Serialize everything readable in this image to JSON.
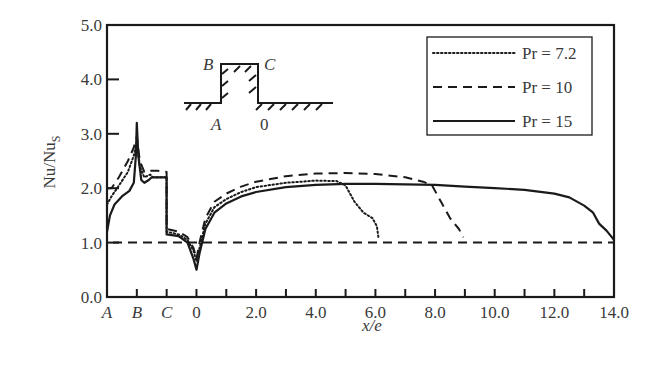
{
  "chart_data": {
    "type": "line",
    "title": "",
    "xlabel": "x/e",
    "ylabel": "Nu/Nu",
    "ylabel_subscript": "S",
    "xlim": [
      -3,
      14
    ],
    "ylim": [
      0,
      5
    ],
    "grid": false,
    "legend_position": "upper right",
    "x_ticks": [
      {
        "value": -3,
        "label": "A",
        "italic": true
      },
      {
        "value": -2,
        "label": "B",
        "italic": true
      },
      {
        "value": -1,
        "label": "C",
        "italic": true
      },
      {
        "value": 0,
        "label": "0",
        "italic": false
      },
      {
        "value": 1,
        "label": "",
        "italic": false
      },
      {
        "value": 2,
        "label": "2.0",
        "italic": false
      },
      {
        "value": 3,
        "label": "",
        "italic": false
      },
      {
        "value": 4,
        "label": "4.0",
        "italic": false
      },
      {
        "value": 5,
        "label": "",
        "italic": false
      },
      {
        "value": 6,
        "label": "6.0",
        "italic": false
      },
      {
        "value": 7,
        "label": "",
        "italic": false
      },
      {
        "value": 8,
        "label": "8.0",
        "italic": false
      },
      {
        "value": 9,
        "label": "",
        "italic": false
      },
      {
        "value": 10,
        "label": "10.0",
        "italic": false
      },
      {
        "value": 11,
        "label": "",
        "italic": false
      },
      {
        "value": 12,
        "label": "12.0",
        "italic": false
      },
      {
        "value": 13,
        "label": "",
        "italic": false
      },
      {
        "value": 14,
        "label": "14.0",
        "italic": false
      }
    ],
    "y_ticks": [
      {
        "value": 0,
        "label": "0.0"
      },
      {
        "value": 1,
        "label": "1.0"
      },
      {
        "value": 2,
        "label": "2.0"
      },
      {
        "value": 3,
        "label": "3.0"
      },
      {
        "value": 4,
        "label": "4.0"
      },
      {
        "value": 5,
        "label": "5.0"
      }
    ],
    "reference_line": {
      "y": 1.0,
      "style": "dashed"
    },
    "series": [
      {
        "name": "Pr = 7.2",
        "style": "dotted",
        "points": [
          [
            -3,
            1.7
          ],
          [
            -2.85,
            1.85
          ],
          [
            -2.6,
            2.05
          ],
          [
            -2.3,
            2.3
          ],
          [
            -2.1,
            2.6
          ],
          [
            -2,
            2.85
          ],
          [
            -1.9,
            2.4
          ],
          [
            -1.75,
            2.2
          ],
          [
            -1.55,
            2.25
          ],
          [
            -1.45,
            2.2
          ],
          [
            -1,
            2.2
          ],
          [
            -1,
            1.2
          ],
          [
            -0.6,
            1.15
          ],
          [
            -0.3,
            1.05
          ],
          [
            -0.1,
            0.85
          ],
          [
            0,
            0.65
          ],
          [
            0.1,
            0.9
          ],
          [
            0.3,
            1.35
          ],
          [
            0.6,
            1.65
          ],
          [
            1,
            1.8
          ],
          [
            1.5,
            1.93
          ],
          [
            2,
            2.02
          ],
          [
            3,
            2.1
          ],
          [
            4,
            2.14
          ],
          [
            4.7,
            2.13
          ],
          [
            5.0,
            2.05
          ],
          [
            5.3,
            1.75
          ],
          [
            5.6,
            1.55
          ],
          [
            5.9,
            1.45
          ],
          [
            6.05,
            1.3
          ],
          [
            6.1,
            1.1
          ]
        ]
      },
      {
        "name": "Pr = 10",
        "style": "dashed",
        "points": [
          [
            -3,
            2.0
          ],
          [
            -2.85,
            2.0
          ],
          [
            -2.6,
            2.2
          ],
          [
            -2.3,
            2.5
          ],
          [
            -2.1,
            2.75
          ],
          [
            -2,
            2.95
          ],
          [
            -1.9,
            2.5
          ],
          [
            -1.75,
            2.3
          ],
          [
            -1.55,
            2.32
          ],
          [
            -1.3,
            2.32
          ],
          [
            -1,
            2.3
          ],
          [
            -1,
            1.25
          ],
          [
            -0.6,
            1.2
          ],
          [
            -0.3,
            1.1
          ],
          [
            -0.1,
            0.9
          ],
          [
            0,
            0.7
          ],
          [
            0.1,
            1.0
          ],
          [
            0.3,
            1.45
          ],
          [
            0.6,
            1.75
          ],
          [
            1,
            1.9
          ],
          [
            1.5,
            2.03
          ],
          [
            2,
            2.12
          ],
          [
            3,
            2.22
          ],
          [
            4,
            2.27
          ],
          [
            5,
            2.28
          ],
          [
            6,
            2.26
          ],
          [
            7,
            2.2
          ],
          [
            7.6,
            2.12
          ],
          [
            7.9,
            2.05
          ],
          [
            8.2,
            1.75
          ],
          [
            8.5,
            1.45
          ],
          [
            8.8,
            1.25
          ],
          [
            8.95,
            1.1
          ]
        ]
      },
      {
        "name": "Pr = 15",
        "style": "solid",
        "points": [
          [
            -3,
            1.2
          ],
          [
            -2.9,
            1.5
          ],
          [
            -2.75,
            1.7
          ],
          [
            -2.5,
            1.85
          ],
          [
            -2.25,
            1.95
          ],
          [
            -2.1,
            2.1
          ],
          [
            -2.03,
            2.6
          ],
          [
            -2,
            3.2
          ],
          [
            -1.95,
            2.6
          ],
          [
            -1.85,
            2.15
          ],
          [
            -1.75,
            2.1
          ],
          [
            -1.6,
            2.15
          ],
          [
            -1.5,
            2.2
          ],
          [
            -1,
            2.2
          ],
          [
            -1,
            1.15
          ],
          [
            -0.6,
            1.12
          ],
          [
            -0.3,
            1.0
          ],
          [
            -0.1,
            0.7
          ],
          [
            0,
            0.5
          ],
          [
            0.1,
            0.8
          ],
          [
            0.3,
            1.25
          ],
          [
            0.6,
            1.55
          ],
          [
            1,
            1.72
          ],
          [
            1.5,
            1.85
          ],
          [
            2,
            1.93
          ],
          [
            3,
            2.02
          ],
          [
            4,
            2.06
          ],
          [
            5,
            2.08
          ],
          [
            6,
            2.08
          ],
          [
            7,
            2.07
          ],
          [
            8,
            2.06
          ],
          [
            9,
            2.03
          ],
          [
            10,
            2.0
          ],
          [
            11,
            1.97
          ],
          [
            12,
            1.9
          ],
          [
            12.5,
            1.83
          ],
          [
            13,
            1.68
          ],
          [
            13.3,
            1.55
          ],
          [
            13.5,
            1.35
          ],
          [
            13.75,
            1.22
          ],
          [
            14,
            1.05
          ]
        ]
      }
    ],
    "inset": {
      "labels": {
        "B": "B",
        "C": "C",
        "A": "A",
        "zero": "0"
      }
    },
    "legend": [
      {
        "label": "Pr = 7.2",
        "style": "dotted"
      },
      {
        "label": "Pr = 10",
        "style": "dashed"
      },
      {
        "label": "Pr = 15",
        "style": "solid"
      }
    ]
  }
}
